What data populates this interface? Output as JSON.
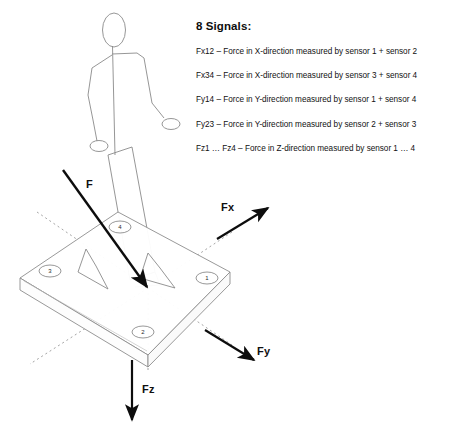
{
  "legend": {
    "title": "8 Signals:",
    "lines": [
      "Fx12 – Force in X-direction measured by sensor 1 + sensor 2",
      "Fx34 – Force in X-direction measured by sensor 3 + sensor 4",
      "Fy14 – Force in Y-direction measured by sensor 1 + sensor 4",
      "Fy23 – Force in Y-direction measured by sensor 2 + sensor 3",
      "Fz1 … Fz4  – Force in Z-direction measured by sensor 1 … 4"
    ]
  },
  "diagram": {
    "force_labels": {
      "resultant": "F",
      "x_axis": "Fx",
      "y_axis": "Fy",
      "z_axis": "Fz"
    },
    "sensors": [
      {
        "id": "1",
        "label": "1"
      },
      {
        "id": "2",
        "label": "2"
      },
      {
        "id": "3",
        "label": "3"
      },
      {
        "id": "4",
        "label": "4"
      }
    ],
    "colors": {
      "line": "#6f6f6f",
      "vector": "#0d0d0d",
      "axis_dotted": "#9a9a9a",
      "text": "#111111"
    }
  }
}
